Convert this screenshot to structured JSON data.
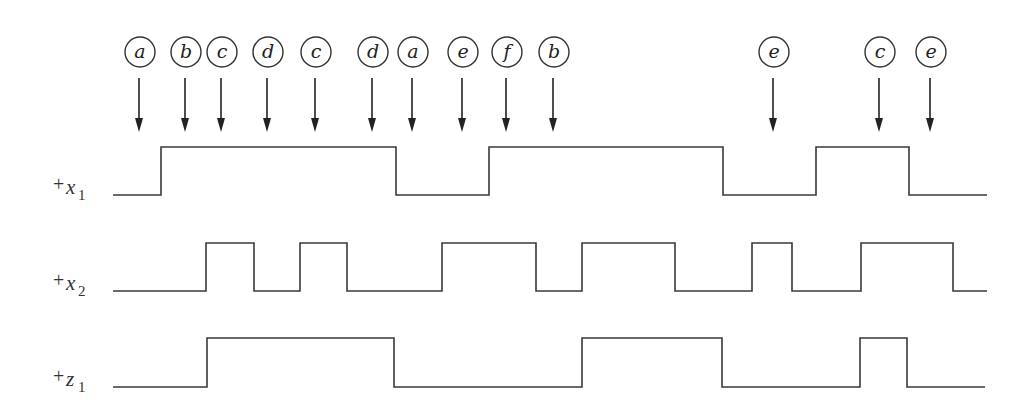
{
  "diagram": {
    "type": "timing-diagram",
    "events": [
      {
        "label": "a",
        "x": 139
      },
      {
        "label": "b",
        "x": 185
      },
      {
        "label": "c",
        "x": 221
      },
      {
        "label": "d",
        "x": 267
      },
      {
        "label": "c",
        "x": 315
      },
      {
        "label": "d",
        "x": 372
      },
      {
        "label": "a",
        "x": 412
      },
      {
        "label": "e",
        "x": 462
      },
      {
        "label": "f",
        "x": 506
      },
      {
        "label": "b",
        "x": 553
      },
      {
        "label": "e",
        "x": 773
      },
      {
        "label": "c",
        "x": 879
      },
      {
        "label": "e",
        "x": 930
      }
    ],
    "signals": [
      {
        "name": "x1",
        "label_prefix": "+",
        "label_var": "x",
        "label_sub": "1",
        "high_y": 147,
        "low_y": 195,
        "start_x": 113,
        "end_x": 987,
        "initial": 0,
        "transitions": [
          161,
          396,
          489,
          723,
          816,
          909
        ]
      },
      {
        "name": "x2",
        "label_prefix": "+",
        "label_var": "x",
        "label_sub": "2",
        "high_y": 243,
        "low_y": 291,
        "start_x": 113,
        "end_x": 987,
        "initial": 0,
        "transitions": [
          206,
          254,
          300,
          347,
          442,
          536,
          582,
          675,
          752,
          792,
          861,
          953
        ]
      },
      {
        "name": "z1",
        "label_prefix": "+",
        "label_var": "z",
        "label_sub": "1",
        "high_y": 338,
        "low_y": 387,
        "start_x": 113,
        "end_x": 985,
        "initial": 0,
        "transitions": [
          207,
          394,
          582,
          722,
          860,
          907
        ]
      }
    ],
    "circle_y": 52,
    "circle_r": 15,
    "arrow_top_y": 78,
    "arrow_tip_y": 132
  }
}
